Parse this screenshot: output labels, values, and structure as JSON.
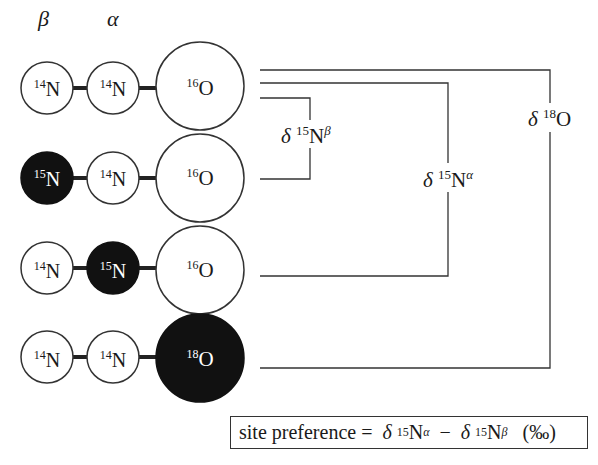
{
  "headers": {
    "beta": "β",
    "alpha": "α"
  },
  "rows": [
    {
      "atoms": [
        {
          "mass": "14",
          "el": "N",
          "filled": false
        },
        {
          "mass": "14",
          "el": "N",
          "filled": false
        },
        {
          "mass": "16",
          "el": "O",
          "filled": false
        }
      ]
    },
    {
      "atoms": [
        {
          "mass": "15",
          "el": "N",
          "filled": true
        },
        {
          "mass": "14",
          "el": "N",
          "filled": false
        },
        {
          "mass": "16",
          "el": "O",
          "filled": false
        }
      ]
    },
    {
      "atoms": [
        {
          "mass": "14",
          "el": "N",
          "filled": false
        },
        {
          "mass": "15",
          "el": "N",
          "filled": true
        },
        {
          "mass": "16",
          "el": "O",
          "filled": false
        }
      ]
    },
    {
      "atoms": [
        {
          "mass": "14",
          "el": "N",
          "filled": false
        },
        {
          "mass": "14",
          "el": "N",
          "filled": false
        },
        {
          "mass": "18",
          "el": "O",
          "filled": true
        }
      ]
    }
  ],
  "labels": {
    "d15n_beta": {
      "delta": "δ",
      "mass": "15",
      "el": "N",
      "site": "β"
    },
    "d15n_alpha": {
      "delta": "δ",
      "mass": "15",
      "el": "N",
      "site": "α"
    },
    "d18o": {
      "delta": "δ",
      "mass": "18",
      "el": "O"
    }
  },
  "formula": {
    "lhs": "site preference =",
    "delta": "δ",
    "mass": "15",
    "el": "N",
    "site_a": "α",
    "minus": "−",
    "site_b": "β",
    "unit": "(‰)"
  },
  "colors": {
    "stroke": "#333333",
    "fill_dark": "#111111",
    "fill_light": "#ffffff"
  }
}
